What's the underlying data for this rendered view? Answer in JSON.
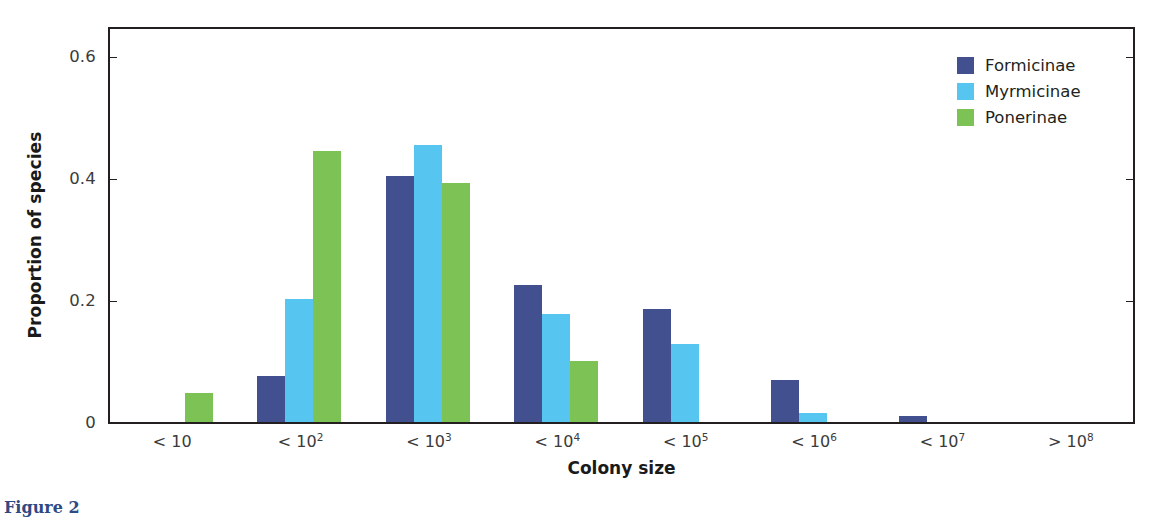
{
  "caption": "Figure 2",
  "legend": {
    "position": "top-right",
    "entries": [
      {
        "label": "Formicinae",
        "color": "#42508f"
      },
      {
        "label": "Myrmicinae",
        "color": "#56c5f0"
      },
      {
        "label": "Ponerinae",
        "color": "#7cc254"
      }
    ]
  },
  "axes": {
    "y_title": "Proportion of species",
    "x_title": "Colony size",
    "y_ticks": [
      "0",
      "0.2",
      "0.4",
      "0.6"
    ],
    "y_tick_values": [
      0,
      0.2,
      0.4,
      0.6
    ]
  },
  "chart_data": {
    "type": "bar",
    "title": "",
    "xlabel": "Colony size",
    "ylabel": "Proportion of species",
    "ylim": [
      0,
      0.65
    ],
    "grid": false,
    "legend_position": "top-right",
    "categories": [
      "< 10",
      "< 10^2",
      "< 10^3",
      "< 10^4",
      "< 10^5",
      "< 10^6",
      "< 10^7",
      "> 10^8"
    ],
    "category_labels": [
      {
        "prefix": "< 10",
        "exponent": ""
      },
      {
        "prefix": "< 10",
        "exponent": "2"
      },
      {
        "prefix": "< 10",
        "exponent": "3"
      },
      {
        "prefix": "< 10",
        "exponent": "4"
      },
      {
        "prefix": "< 10",
        "exponent": "5"
      },
      {
        "prefix": "< 10",
        "exponent": "6"
      },
      {
        "prefix": "< 10",
        "exponent": "7"
      },
      {
        "prefix": "> 10",
        "exponent": "8"
      }
    ],
    "series": [
      {
        "name": "Formicinae",
        "color": "#42508f",
        "values": [
          0,
          0.075,
          0.403,
          0.225,
          0.185,
          0.068,
          0.01,
          0
        ]
      },
      {
        "name": "Myrmicinae",
        "color": "#56c5f0",
        "values": [
          0,
          0.202,
          0.453,
          0.177,
          0.128,
          0.014,
          0,
          0
        ]
      },
      {
        "name": "Ponerinae",
        "color": "#7cc254",
        "values": [
          0.048,
          0.444,
          0.392,
          0.1,
          0,
          0,
          0,
          0
        ]
      }
    ]
  }
}
